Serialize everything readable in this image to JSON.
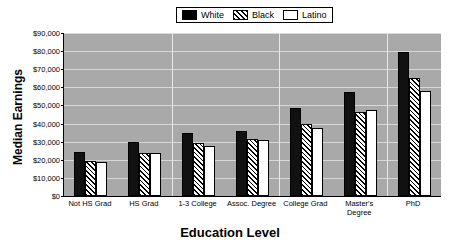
{
  "chart_data": {
    "type": "bar",
    "title": "",
    "xlabel": "Education Level",
    "ylabel": "Median Earnings",
    "categories": [
      "Not HS Grad",
      "HS Grad",
      "1-3 College",
      "Assoc. Degree",
      "College Grad",
      "Master's Degree",
      "PhD"
    ],
    "series": [
      {
        "name": "White",
        "values": [
          24500,
          30000,
          35000,
          36000,
          48500,
          57500,
          79500
        ]
      },
      {
        "name": "Black",
        "values": [
          19500,
          24000,
          29000,
          31500,
          39500,
          46500,
          65000
        ]
      },
      {
        "name": "Latino",
        "values": [
          19000,
          24000,
          27500,
          31000,
          37500,
          47500,
          58000
        ]
      }
    ],
    "ylim": [
      0,
      90000
    ],
    "ytick_values": [
      0,
      10000,
      20000,
      30000,
      40000,
      50000,
      60000,
      70000,
      80000,
      90000
    ],
    "ytick_labels": [
      "$0",
      "$10,000",
      "$20,000",
      "$30,000",
      "$40,000",
      "$50,000",
      "$60,000",
      "$70,000",
      "$80,000",
      "$90,000"
    ],
    "grid": true,
    "legend_position": "top-center",
    "plot_background_color": "#a9a9a9",
    "gridline_color": "#d8d8d8",
    "series_fills": [
      "solid-black",
      "diagonal-hatch",
      "white-empty"
    ]
  },
  "legend": {
    "entries": [
      {
        "label": "White",
        "swatch": "solid-black-swatch"
      },
      {
        "label": "Black",
        "swatch": "diagonal-hatch-swatch"
      },
      {
        "label": "Latino",
        "swatch": "white-empty-swatch"
      }
    ]
  },
  "axes": {
    "y_title": "Median Earnings",
    "x_title": "Education Level"
  }
}
